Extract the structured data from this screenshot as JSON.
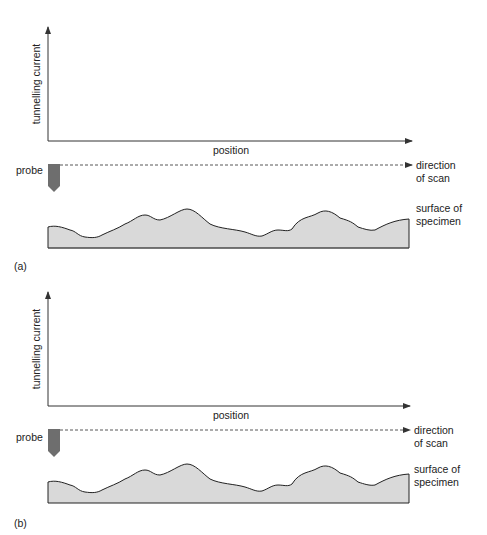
{
  "colors": {
    "axis": "#333333",
    "surface_fill": "#d9d9d9",
    "surface_stroke": "#222222",
    "probe": "#6e6e6e",
    "text": "#222222"
  },
  "panels": [
    {
      "id": "a",
      "panel_label": "(a)",
      "y_axis_label": "tunnelling current",
      "x_axis_label": "position",
      "probe_label": "probe",
      "scan_label_line1": "direction",
      "scan_label_line2": "of scan",
      "surface_label_line1": "surface of",
      "surface_label_line2": "specimen",
      "offset_y": 0
    },
    {
      "id": "b",
      "panel_label": "(b)",
      "y_axis_label": "tunnelling current",
      "x_axis_label": "position",
      "probe_label": "probe",
      "scan_label_line1": "direction",
      "scan_label_line2": "of scan",
      "surface_label_line1": "surface of",
      "surface_label_line2": "specimen",
      "offset_y": 265
    }
  ]
}
